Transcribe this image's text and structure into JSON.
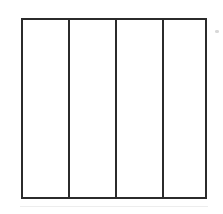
{
  "document": {
    "kind": "scanned-line-diagram",
    "title": "Blank four-column grid",
    "background_color": "#ffffff",
    "canvas": {
      "width": 223,
      "height": 214
    }
  },
  "figure": {
    "name": "four-column-grid",
    "shape": "rectangle",
    "stroke_color": "#2b2b2b",
    "stroke_width_px": 2,
    "fill_color": "#ffffff",
    "bounds": {
      "x": 21,
      "y": 18,
      "width": 186,
      "height": 181
    },
    "column_count": 4,
    "row_count": 1,
    "dividers": {
      "orientation": "vertical",
      "count": 3,
      "x_positions": [
        68,
        115,
        162
      ]
    },
    "cells": [
      {
        "index": 1,
        "label": "",
        "x": 23,
        "width": 45,
        "content": ""
      },
      {
        "index": 2,
        "label": "",
        "x": 70,
        "width": 45,
        "content": ""
      },
      {
        "index": 3,
        "label": "",
        "x": 117,
        "width": 45,
        "content": ""
      },
      {
        "index": 4,
        "label": "",
        "x": 164,
        "width": 43,
        "content": ""
      }
    ]
  },
  "artifacts": {
    "speck": {
      "name": "scan-speck",
      "color": "#d8d8d8",
      "x": 215,
      "y": 30,
      "width": 4,
      "height": 3
    },
    "underline": {
      "name": "scan-baseline-smudge",
      "color": "#ededed",
      "x": 20,
      "y": 206,
      "width": 188
    }
  }
}
